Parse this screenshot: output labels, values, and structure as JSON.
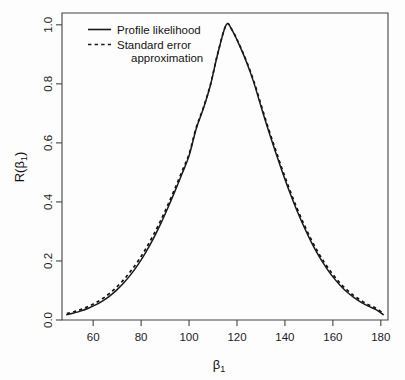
{
  "chart_data": {
    "type": "line",
    "title": "",
    "subtitle": "",
    "xlabel": "β₁",
    "ylabel": "R(β₁)",
    "xlim": [
      47,
      183
    ],
    "ylim": [
      0.0,
      1.04
    ],
    "grid": false,
    "legend_position": "top-left",
    "xticks": [
      60,
      80,
      100,
      120,
      140,
      160,
      180
    ],
    "xtick_labels": [
      "60",
      "80",
      "100",
      "120",
      "140",
      "160",
      "180"
    ],
    "yticks": [
      0.0,
      0.2,
      0.4,
      0.6,
      0.8,
      1.0
    ],
    "ytick_labels": [
      "0.0",
      "0.2",
      "0.4",
      "0.6",
      "0.8",
      "1.0"
    ],
    "peak": {
      "x": 115.5,
      "y": 1.0
    },
    "sigma": 21.2,
    "series": [
      {
        "name": "Profile likelihood",
        "style": "solid",
        "color": "#1a1a1a",
        "x": [
          49,
          52,
          55,
          58,
          61,
          64,
          67,
          70,
          73,
          76,
          79,
          82,
          85,
          88,
          91,
          94,
          97,
          100,
          103,
          106,
          109,
          112,
          115.5,
          118,
          121,
          124,
          127,
          130,
          133,
          136,
          139,
          142,
          145,
          148,
          151,
          154,
          157,
          160,
          163,
          166,
          169,
          172,
          175,
          178,
          181
        ],
        "y": [
          0.018,
          0.024,
          0.031,
          0.04,
          0.051,
          0.065,
          0.082,
          0.103,
          0.128,
          0.157,
          0.191,
          0.23,
          0.274,
          0.323,
          0.377,
          0.434,
          0.494,
          0.556,
          0.648,
          0.717,
          0.798,
          0.903,
          1.0,
          0.981,
          0.931,
          0.873,
          0.805,
          0.724,
          0.645,
          0.571,
          0.5,
          0.433,
          0.371,
          0.315,
          0.264,
          0.219,
          0.18,
          0.146,
          0.118,
          0.094,
          0.075,
          0.059,
          0.046,
          0.035,
          0.018
        ]
      },
      {
        "name": "Standard error approximation",
        "style": "dashed",
        "color": "#111111",
        "x": [
          49,
          52,
          55,
          58,
          61,
          64,
          67,
          70,
          73,
          76,
          79,
          82,
          85,
          88,
          91,
          94,
          97,
          100,
          103,
          106,
          109,
          112,
          115.5,
          118,
          121,
          124,
          127,
          130,
          133,
          136,
          139,
          142,
          145,
          148,
          151,
          154,
          157,
          160,
          163,
          166,
          169,
          172,
          175,
          178,
          181
        ],
        "y": [
          0.022,
          0.028,
          0.036,
          0.046,
          0.058,
          0.073,
          0.091,
          0.113,
          0.139,
          0.169,
          0.203,
          0.242,
          0.286,
          0.334,
          0.387,
          0.443,
          0.502,
          0.562,
          0.652,
          0.72,
          0.8,
          0.904,
          1.0,
          0.982,
          0.933,
          0.876,
          0.81,
          0.73,
          0.652,
          0.579,
          0.508,
          0.441,
          0.379,
          0.323,
          0.272,
          0.227,
          0.188,
          0.154,
          0.125,
          0.101,
          0.081,
          0.065,
          0.051,
          0.04,
          0.022
        ]
      }
    ]
  },
  "legend": {
    "entries": [
      {
        "label": "Profile likelihood",
        "label_cont": "",
        "style": "solid"
      },
      {
        "label": "Standard error",
        "label_cont": "approximation",
        "style": "dashed"
      }
    ]
  },
  "axes": {
    "x_title": "β₁",
    "x_title_base": "β",
    "x_title_sub": "1",
    "y_title": "R(β₁)",
    "y_title_base": "R(β",
    "y_title_sub": "1",
    "y_title_tail": ")"
  },
  "colors": {
    "background": "#fdfdfd",
    "axis": "#444444",
    "curve": "#1a1a1a",
    "text": "#141414"
  }
}
